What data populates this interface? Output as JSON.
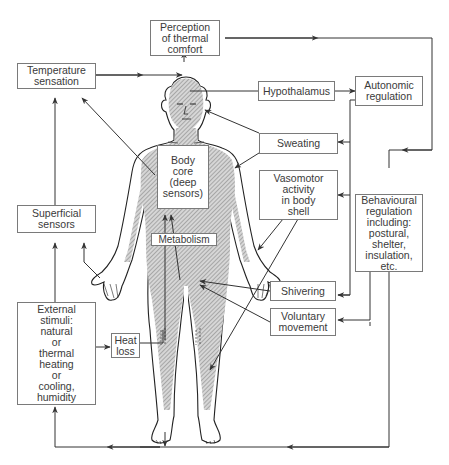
{
  "diagram": {
    "type": "thermoregulation flow diagram with human body figure",
    "colors": {
      "line": "#3a3a3a",
      "box_border": "#7a7a7a",
      "body_shading": "#b5b5b5",
      "text": "#3a3a3a",
      "background": "#ffffff"
    },
    "boxes": {
      "perception": "Perception\nof thermal\ncomfort",
      "temperature_sensation": "Temperature\nsensation",
      "hypothalamus": "Hypothalamus",
      "autonomic_regulation": "Autonomic\nregulation",
      "sweating": "Sweating",
      "body_core": "Body\ncore\n(deep\nsensors)",
      "vasomotor": "Vasomotor\nactivity\nin body\nshell",
      "behavioural": "Behavioural\nregulation\nincluding:\npostural,\nshelter,\ninsulation,\netc.",
      "superficial_sensors": "Superficial\nsensors",
      "metabolism": "Metabolism",
      "shivering": "Shivering",
      "voluntary_movement": "Voluntary\nmovement",
      "external_stimuli": "External\nstimuli:\nnatural\nor\nthermal\nheating\nor\ncooling,\nhumidity",
      "heat_loss": "Heat\nloss"
    },
    "connections": [
      {
        "from": "Temperature sensation",
        "to": "Head (brain)"
      },
      {
        "from": "Head (brain)",
        "to": "Perception of thermal comfort"
      },
      {
        "from": "Perception of thermal comfort",
        "to": "Behavioural regulation"
      },
      {
        "from": "Head (hypothalamus)",
        "to": "Hypothalamus"
      },
      {
        "from": "Hypothalamus",
        "to": "Autonomic regulation"
      },
      {
        "from": "Autonomic regulation",
        "to": "Sweating"
      },
      {
        "from": "Autonomic regulation",
        "to": "Vasomotor activity in body shell"
      },
      {
        "from": "Autonomic regulation",
        "to": "Shivering"
      },
      {
        "from": "Sweating",
        "to": "Head skin"
      },
      {
        "from": "Sweating",
        "to": "Arm skin"
      },
      {
        "from": "Vasomotor activity in body shell",
        "to": "Hand"
      },
      {
        "from": "Vasomotor activity in body shell",
        "to": "Leg"
      },
      {
        "from": "Shivering",
        "to": "Thigh muscle"
      },
      {
        "from": "Voluntary movement",
        "to": "Thigh muscle"
      },
      {
        "from": "Behavioural regulation",
        "to": "Voluntary movement"
      },
      {
        "from": "Behavioural regulation",
        "to": "External stimuli (bottom loop)"
      },
      {
        "from": "Body core",
        "to": "Temperature sensation"
      },
      {
        "from": "Metabolism",
        "to": "Body core"
      },
      {
        "from": "Superficial sensors",
        "to": "Temperature sensation"
      },
      {
        "from": "Hand",
        "to": "Superficial sensors"
      },
      {
        "from": "External stimuli",
        "to": "Superficial sensors"
      },
      {
        "from": "External stimuli",
        "to": "Heat loss"
      },
      {
        "from": "Heat loss",
        "to": "Leg"
      },
      {
        "from": "Feet",
        "to": "bottom loop"
      },
      {
        "from": "bottom loop",
        "to": "External stimuli"
      }
    ]
  }
}
